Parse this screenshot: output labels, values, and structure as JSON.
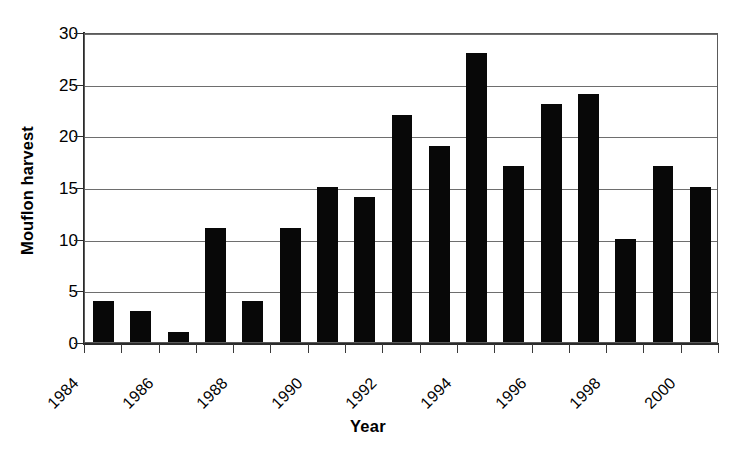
{
  "chart_data": {
    "type": "bar",
    "title": "",
    "subtitle": "",
    "xlabel": "Year",
    "ylabel": "Mouflon harvest",
    "categories": [
      1984,
      1985,
      1986,
      1987,
      1988,
      1989,
      1990,
      1991,
      1992,
      1993,
      1994,
      1995,
      1996,
      1997,
      1998,
      1999,
      2000
    ],
    "values": [
      4,
      3,
      1,
      11,
      4,
      11,
      15,
      14,
      22,
      19,
      28,
      17,
      23,
      24,
      10,
      17,
      15
    ],
    "series": [
      {
        "name": "Mouflon harvest",
        "values": [
          4,
          3,
          1,
          11,
          4,
          11,
          15,
          14,
          22,
          19,
          28,
          17,
          23,
          24,
          10,
          17,
          15
        ]
      }
    ],
    "ylim": [
      0,
      30
    ],
    "yticks": [
      0,
      5,
      10,
      15,
      20,
      25,
      30
    ],
    "ytick_labels": [
      "0",
      "5",
      "10",
      "15",
      "20",
      "25",
      "30"
    ],
    "xtick_labels": [
      "1984",
      "1986",
      "1988",
      "1990",
      "1992",
      "1994",
      "1996",
      "1998",
      "2000"
    ],
    "xtick_label_years": [
      1984,
      1986,
      1988,
      1990,
      1992,
      1994,
      1996,
      1998,
      2000
    ],
    "xtick_label_rotation": -45,
    "grid": true,
    "grid_axis": "y",
    "legend": false,
    "legend_position": "none",
    "bar_color": "#080808",
    "grid_color": "#6e6e6e",
    "axis_color": "#2b2b2b",
    "background_color": "#ffffff",
    "annotations": []
  }
}
